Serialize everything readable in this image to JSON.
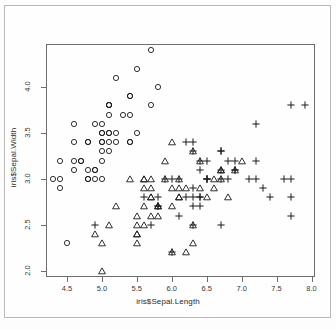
{
  "chart_data": {
    "type": "scatter",
    "title": "",
    "xlabel": "iris$Sepal.Length",
    "ylabel": "iris$Sepal.Width",
    "xlim": [
      4.2,
      8.05
    ],
    "ylim": [
      1.93,
      4.47
    ],
    "xticks": [
      "4.5",
      "5.0",
      "5.5",
      "6.0",
      "6.5",
      "7.0",
      "7.5",
      "8.0"
    ],
    "xtick_values": [
      4.5,
      5.0,
      5.5,
      6.0,
      6.5,
      7.0,
      7.5,
      8.0
    ],
    "yticks": [
      "2.0",
      "2.5",
      "3.0",
      "3.5",
      "4.0"
    ],
    "ytick_values": [
      2.0,
      2.5,
      3.0,
      3.5,
      4.0
    ],
    "grid": false,
    "legend": "none",
    "point_color": "#1a1a1a",
    "panel_border_color": "#6d6d6d",
    "series": [
      {
        "name": "setosa",
        "symbol": "circle",
        "x": [
          5.1,
          4.9,
          4.7,
          4.6,
          5.0,
          5.4,
          4.6,
          5.0,
          4.4,
          4.9,
          5.4,
          4.8,
          4.8,
          4.3,
          5.8,
          5.7,
          5.4,
          5.1,
          5.7,
          5.1,
          5.4,
          5.1,
          4.6,
          5.1,
          4.8,
          5.0,
          5.0,
          5.2,
          5.2,
          4.7,
          4.8,
          5.4,
          5.2,
          5.5,
          4.9,
          5.0,
          5.5,
          4.9,
          4.4,
          5.1,
          5.0,
          4.5,
          4.4,
          5.0,
          5.1,
          4.8,
          5.1,
          4.6,
          5.3,
          5.0
        ],
        "y": [
          3.5,
          3.0,
          3.2,
          3.1,
          3.6,
          3.9,
          3.4,
          3.4,
          2.9,
          3.1,
          3.7,
          3.4,
          3.0,
          3.0,
          4.0,
          4.4,
          3.9,
          3.5,
          3.8,
          3.8,
          3.4,
          3.7,
          3.6,
          3.3,
          3.4,
          3.0,
          3.4,
          3.5,
          3.4,
          3.2,
          3.1,
          3.4,
          4.1,
          4.2,
          3.1,
          3.2,
          3.5,
          3.6,
          3.0,
          3.4,
          3.5,
          2.3,
          3.2,
          3.5,
          3.8,
          3.0,
          3.8,
          3.2,
          3.7,
          3.3
        ]
      },
      {
        "name": "versicolor",
        "symbol": "triangle",
        "x": [
          7.0,
          6.4,
          6.9,
          5.5,
          6.5,
          5.7,
          6.3,
          4.9,
          6.6,
          5.2,
          5.0,
          5.9,
          6.0,
          6.1,
          5.6,
          6.7,
          5.6,
          5.8,
          6.2,
          5.6,
          5.9,
          6.1,
          6.3,
          6.1,
          6.4,
          6.6,
          6.8,
          6.7,
          6.0,
          5.7,
          5.5,
          5.5,
          5.8,
          6.0,
          5.4,
          6.0,
          6.7,
          6.3,
          5.6,
          5.5,
          5.5,
          6.1,
          5.8,
          5.0,
          5.6,
          5.7,
          5.7,
          6.2,
          5.1,
          5.7
        ],
        "y": [
          3.2,
          3.2,
          3.1,
          2.3,
          2.8,
          2.8,
          3.3,
          2.4,
          2.9,
          2.7,
          2.0,
          3.0,
          2.2,
          2.9,
          2.9,
          3.1,
          3.0,
          2.7,
          2.2,
          2.5,
          3.2,
          2.8,
          2.5,
          2.8,
          2.9,
          3.0,
          2.8,
          3.0,
          2.9,
          2.6,
          2.4,
          2.4,
          2.7,
          2.7,
          3.0,
          3.4,
          3.1,
          2.3,
          3.0,
          2.5,
          2.6,
          3.0,
          2.6,
          2.3,
          2.7,
          3.0,
          2.9,
          2.9,
          2.5,
          2.8
        ]
      },
      {
        "name": "virginica",
        "symbol": "plus",
        "x": [
          6.3,
          5.8,
          7.1,
          6.3,
          6.5,
          7.6,
          4.9,
          7.3,
          6.7,
          7.2,
          6.5,
          6.4,
          6.8,
          5.7,
          5.8,
          6.4,
          6.5,
          7.7,
          7.7,
          6.0,
          6.9,
          5.6,
          7.7,
          6.3,
          6.7,
          7.2,
          6.2,
          6.1,
          6.4,
          7.2,
          7.4,
          7.9,
          6.4,
          6.3,
          6.1,
          7.7,
          6.3,
          6.4,
          6.0,
          6.9,
          6.7,
          6.9,
          5.8,
          6.8,
          6.7,
          6.7,
          6.3,
          6.5,
          6.2,
          5.9
        ],
        "y": [
          3.3,
          2.7,
          3.0,
          2.9,
          3.0,
          3.0,
          2.5,
          2.9,
          2.5,
          3.6,
          3.2,
          2.7,
          3.0,
          2.5,
          2.8,
          3.2,
          3.0,
          3.8,
          2.6,
          2.2,
          3.2,
          2.8,
          2.8,
          2.7,
          3.3,
          3.2,
          2.8,
          3.0,
          2.8,
          3.0,
          2.8,
          3.8,
          2.8,
          2.8,
          2.6,
          3.0,
          3.4,
          3.1,
          3.0,
          3.1,
          3.1,
          3.1,
          2.7,
          3.2,
          3.3,
          3.0,
          2.5,
          3.0,
          3.4,
          3.0
        ]
      }
    ]
  }
}
